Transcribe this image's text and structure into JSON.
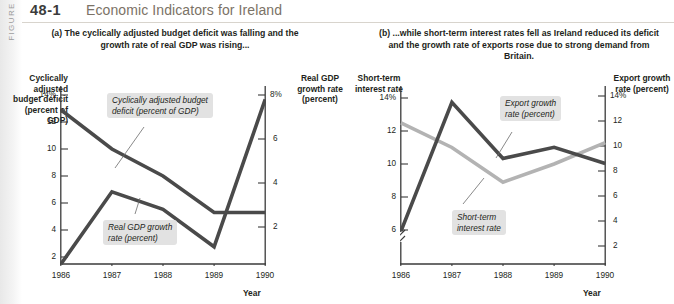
{
  "figure": {
    "sidebar_label": "FIGURE",
    "number": "48-1",
    "title": "Economic Indicators for Ireland"
  },
  "panels": {
    "a": {
      "caption": "(a) The cyclically adjusted budget deficit was falling and the growth rate of real GDP was rising...",
      "left_axis_title": "Cyclically adjusted budget deficit (percent of GDP)",
      "right_axis_title": "Real GDP growth rate (percent)",
      "x_axis_title": "Year",
      "left_ticks": [
        "14%",
        "12",
        "10",
        "8",
        "6",
        "4",
        "2"
      ],
      "right_ticks": [
        "8%",
        "6",
        "4",
        "2"
      ],
      "x_ticks": [
        "1986",
        "1987",
        "1988",
        "1989",
        "1990"
      ],
      "callout_deficit": "Cyclically adjusted budget\ndeficit (percent of GDP)",
      "callout_gdp": "Real GDP growth\nrate (percent)"
    },
    "b": {
      "caption": "(b) ...while short-term interest rates fell as Ireland reduced its deficit and the growth rate of exports rose due to strong demand from Britain.",
      "left_axis_title": "Short-term interest rate",
      "right_axis_title": "Export growth rate (percent)",
      "x_axis_title": "Year",
      "left_ticks": [
        "14%",
        "12",
        "10",
        "8",
        "6"
      ],
      "right_ticks": [
        "14%",
        "12",
        "10",
        "8",
        "6",
        "4",
        "2"
      ],
      "x_ticks": [
        "1986",
        "1987",
        "1988",
        "1989",
        "1990"
      ],
      "callout_export": "Export growth\nrate (percent)",
      "callout_interest": "Short-term\ninterest rate",
      "axis_break": true
    }
  },
  "colors": {
    "dark_line": "#4a4a4a",
    "light_line": "#b3b3b3",
    "callout_bg": "#e2e2e2",
    "title_text": "#7b7266",
    "axis_text": "#231f20"
  },
  "chart_data": [
    {
      "type": "line",
      "title": "(a) The cyclically adjusted budget deficit was falling and the growth rate of real GDP was rising...",
      "x": [
        1986,
        1987,
        1988,
        1989,
        1990
      ],
      "xlabel": "Year",
      "series": [
        {
          "name": "Cyclically adjusted budget deficit (percent of GDP)",
          "axis": "left",
          "color": "#4a4a4a",
          "values": [
            12.9,
            10.0,
            8.0,
            5.3,
            5.3
          ]
        },
        {
          "name": "Real GDP growth rate (percent)",
          "axis": "right",
          "color": "#4a4a4a",
          "values": [
            0.3,
            3.6,
            2.8,
            1.1,
            7.8
          ]
        }
      ],
      "left_axis": {
        "label": "Cyclically adjusted budget deficit (percent of GDP)",
        "ticks": [
          2,
          4,
          6,
          8,
          10,
          12,
          14
        ],
        "lim": [
          0.6,
          14
        ]
      },
      "right_axis": {
        "label": "Real GDP growth rate (percent)",
        "ticks": [
          2,
          4,
          6,
          8
        ],
        "lim": [
          0.0,
          8.6
        ]
      },
      "grid": false,
      "legend": "inline-callouts"
    },
    {
      "type": "line",
      "title": "(b) ...while short-term interest rates fell as Ireland reduced its deficit and the growth rate of exports rose due to strong demand from Britain.",
      "x": [
        1986,
        1987,
        1988,
        1989,
        1990
      ],
      "xlabel": "Year",
      "series": [
        {
          "name": "Short-term interest rate",
          "axis": "left",
          "color": "#b3b3b3",
          "values": [
            12.5,
            11.0,
            8.9,
            10.0,
            11.3
          ]
        },
        {
          "name": "Export growth rate (percent)",
          "axis": "right",
          "color": "#4a4a4a",
          "values": [
            3.2,
            13.5,
            9.0,
            9.9,
            8.6
          ]
        }
      ],
      "left_axis": {
        "label": "Short-term interest rate",
        "ticks": [
          6,
          8,
          10,
          12,
          14
        ],
        "lim": [
          5.6,
          14.5
        ],
        "break": true
      },
      "right_axis": {
        "label": "Export growth rate (percent)",
        "ticks": [
          2,
          4,
          6,
          8,
          10,
          12,
          14
        ],
        "lim": [
          1.2,
          14.8
        ]
      },
      "grid": false,
      "legend": "inline-callouts"
    }
  ]
}
